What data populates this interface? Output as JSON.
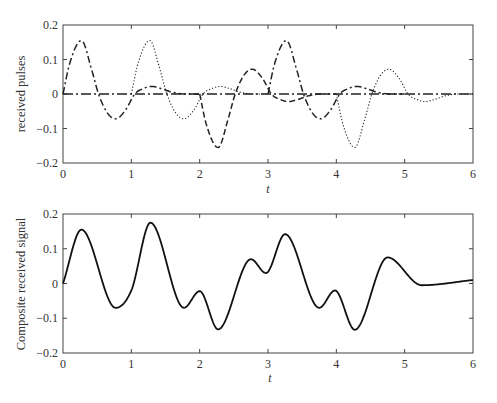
{
  "chart_data": [
    {
      "type": "line",
      "title": "",
      "xlabel": "t",
      "ylabel": "received pulses",
      "xlim": [
        0,
        6
      ],
      "ylim": [
        -0.2,
        0.2
      ],
      "xticks": [
        "0",
        "1",
        "2",
        "3",
        "4",
        "5",
        "6"
      ],
      "yticks": [
        "0.2",
        "0.1",
        "0",
        "−0.1",
        "−0.2"
      ],
      "grid": false,
      "legend": null,
      "pulse_shape": {
        "tau": [
          0,
          0.1,
          0.27,
          0.42,
          0.52,
          0.65,
          0.77,
          0.92,
          1.05,
          1.18,
          1.3,
          1.45,
          1.6,
          1.8,
          6
        ],
        "value": [
          0,
          0.09,
          0.155,
          0.07,
          0,
          -0.055,
          -0.072,
          -0.045,
          0,
          0.016,
          0.022,
          0.015,
          0.005,
          0,
          0
        ]
      },
      "series": [
        {
          "name": "pulse 1",
          "start": 0,
          "sign": 1,
          "style": "dash-dot",
          "peak_t": 0.27,
          "peak_value": 0.155
        },
        {
          "name": "pulse 2",
          "start": 1,
          "sign": 1,
          "style": "dotted",
          "peak_t": 1.27,
          "peak_value": 0.155
        },
        {
          "name": "pulse 3",
          "start": 2,
          "sign": -1,
          "style": "dashed",
          "peak_t": 2.27,
          "peak_value": -0.155
        },
        {
          "name": "pulse 4",
          "start": 3,
          "sign": 1,
          "style": "dash-dot",
          "peak_t": 3.27,
          "peak_value": 0.155
        },
        {
          "name": "pulse 5",
          "start": 4,
          "sign": -1,
          "style": "dotted",
          "peak_t": 4.27,
          "peak_value": -0.155
        }
      ]
    },
    {
      "type": "line",
      "title": "",
      "xlabel": "t",
      "ylabel": "Composite received signal",
      "xlim": [
        0,
        6
      ],
      "ylim": [
        -0.2,
        0.2
      ],
      "xticks": [
        "0",
        "1",
        "2",
        "3",
        "4",
        "5",
        "6"
      ],
      "yticks": [
        "0.2",
        "0.1",
        "0",
        "−0.1",
        "−0.2"
      ],
      "grid": false,
      "legend": null,
      "series": [
        {
          "name": "composite signal",
          "style": "solid",
          "x": [
            0,
            0.27,
            0.77,
            1.0,
            1.28,
            1.77,
            2.0,
            2.27,
            2.75,
            2.97,
            3.25,
            3.75,
            3.98,
            4.27,
            4.75,
            5.25,
            6.0
          ],
          "y": [
            0,
            0.155,
            -0.07,
            -0.02,
            0.175,
            -0.07,
            -0.022,
            -0.132,
            0.07,
            0.03,
            0.142,
            -0.07,
            -0.02,
            -0.133,
            0.075,
            -0.005,
            0.01
          ]
        }
      ]
    }
  ],
  "plots": {
    "top": {
      "ylabel": "received pulses",
      "xlabel": "t"
    },
    "bottom": {
      "ylabel": "Composite received signal",
      "xlabel": "t"
    }
  }
}
